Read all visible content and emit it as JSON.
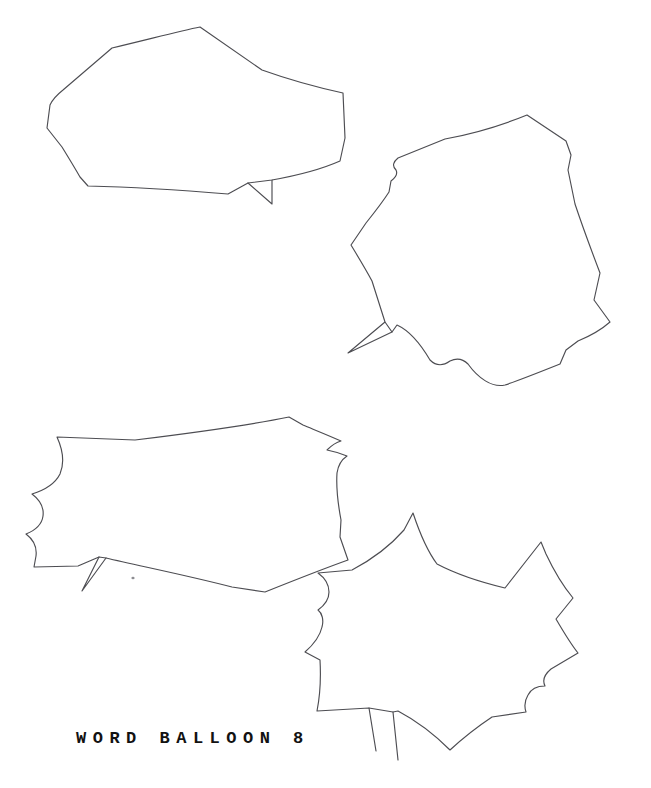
{
  "page": {
    "background_color": "#ffffff",
    "ink_color": "#4d4d52",
    "width": 651,
    "height": 788
  },
  "caption": {
    "text": "WORD BALLOON 8",
    "color": "#121212"
  },
  "balloons": [
    {
      "id": "balloon-1",
      "label": "wide flattened polygonal word balloon",
      "tail_direction": "down-right",
      "bbox": "x 47 y 27 w 303 h 180"
    },
    {
      "id": "balloon-2",
      "label": "round many-sided word balloon",
      "tail_direction": "down-left",
      "bbox": "x 347 y 113 w 270 h 262"
    },
    {
      "id": "balloon-3",
      "label": "wide scalloped word balloon",
      "tail_direction": "down-left",
      "bbox": "x 22 y 417 w 320 h 175"
    },
    {
      "id": "balloon-4",
      "label": "spiky star-edged word balloon",
      "tail_direction": "down-left",
      "bbox": "x 305 y 513 w 275 h 248"
    }
  ]
}
